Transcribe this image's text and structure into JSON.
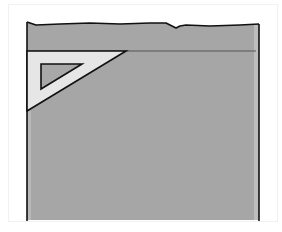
{
  "illustration": {
    "subject": "set-square on paper sheet",
    "colors": {
      "background": "#ffffff",
      "card_border": "#efefef",
      "sheet_fill": "#a6a6a6",
      "sheet_right_strip": "#bdbdbd",
      "outline": "#111111",
      "guide_line": "#555555",
      "set_square_fill": "#e6e6e6",
      "set_square_cutout": "#a8a8a8"
    }
  }
}
